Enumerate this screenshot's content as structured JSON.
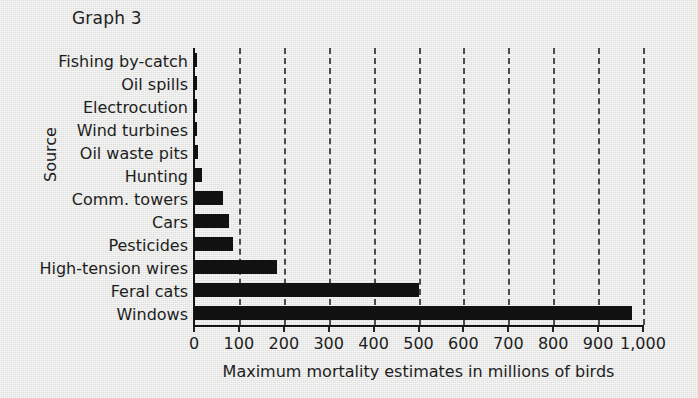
{
  "chart_data": {
    "type": "bar",
    "orientation": "horizontal",
    "title": "Graph 3",
    "xlabel": "Maximum mortality estimates in millions of birds",
    "ylabel": "Source",
    "xlim": [
      0,
      1000
    ],
    "xticks": [
      0,
      100,
      200,
      300,
      400,
      500,
      600,
      700,
      800,
      900,
      1000
    ],
    "xtick_labels": [
      "0",
      "100",
      "200",
      "300",
      "400",
      "500",
      "600",
      "700",
      "800",
      "900",
      "1,000"
    ],
    "grid": "vertical-dashed",
    "legend": "none",
    "bar_color": "#111111",
    "categories": [
      "Fishing by-catch",
      "Oil spills",
      "Electrocution",
      "Wind turbines",
      "Oil waste pits",
      "Hunting",
      "Comm. towers",
      "Cars",
      "Pesticides",
      "High-tension wires",
      "Feral cats",
      "Windows"
    ],
    "values": [
      5,
      5,
      5,
      4,
      9,
      18,
      65,
      78,
      87,
      185,
      500,
      975
    ]
  },
  "figure": {
    "background_color": "#e3e3e1",
    "text_color": "#1d1d1d",
    "gridline_color": "#4c4c4c",
    "axis_color": "#151515"
  }
}
